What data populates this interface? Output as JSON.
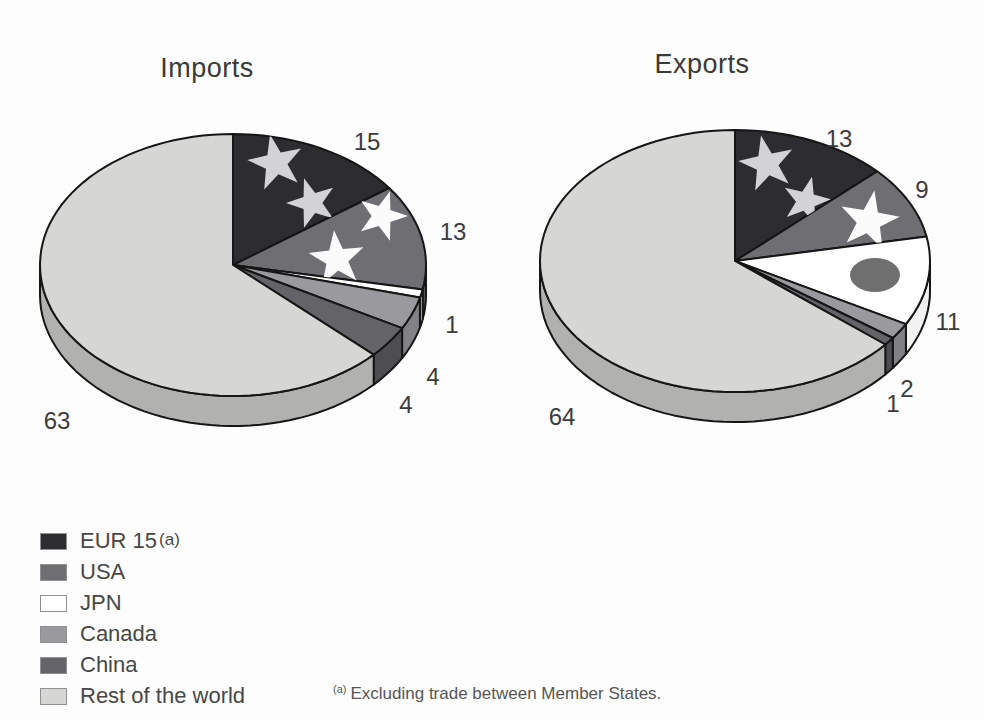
{
  "chart_data": [
    {
      "type": "pie",
      "title": "Imports",
      "start_angle_deg": 0,
      "direction": "clockwise",
      "slices": [
        {
          "label": "EUR 15",
          "value": 15,
          "color_key": "eur15"
        },
        {
          "label": "USA",
          "value": 13,
          "color_key": "usa"
        },
        {
          "label": "JPN",
          "value": 1,
          "color_key": "jpn"
        },
        {
          "label": "Canada",
          "value": 4,
          "color_key": "canada"
        },
        {
          "label": "China",
          "value": 4,
          "color_key": "china"
        },
        {
          "label": "Rest of the world",
          "value": 63,
          "color_key": "rest"
        }
      ],
      "geom": {
        "cx": 233,
        "cy": 265,
        "rx": 193,
        "ry": 131,
        "depth": 30
      },
      "value_label_pos": [
        {
          "x": 367,
          "y": 150
        },
        {
          "x": 453,
          "y": 240
        },
        {
          "x": 452,
          "y": 333
        },
        {
          "x": 433,
          "y": 385
        },
        {
          "x": 406,
          "y": 413
        },
        {
          "x": 57,
          "y": 429
        }
      ],
      "decorations": [
        {
          "slice": 0,
          "shape": "star",
          "name": "eu-flag-star",
          "x": 276,
          "y": 163,
          "r": 29,
          "rot": -12,
          "color_key": "star_light"
        },
        {
          "slice": 0,
          "shape": "star",
          "name": "eu-flag-star",
          "x": 312,
          "y": 203,
          "r": 26,
          "rot": -18,
          "color_key": "star_light"
        },
        {
          "slice": 1,
          "shape": "star",
          "name": "us-flag-star",
          "x": 382,
          "y": 216,
          "r": 26,
          "rot": 18,
          "color_key": "star_white"
        },
        {
          "slice": 1,
          "shape": "star",
          "name": "us-flag-star",
          "x": 337,
          "y": 259,
          "r": 29,
          "rot": -6,
          "color_key": "star_white"
        }
      ]
    },
    {
      "type": "pie",
      "title": "Exports",
      "start_angle_deg": 0,
      "direction": "clockwise",
      "slices": [
        {
          "label": "EUR 15",
          "value": 13,
          "color_key": "eur15"
        },
        {
          "label": "USA",
          "value": 9,
          "color_key": "usa"
        },
        {
          "label": "JPN",
          "value": 11,
          "color_key": "jpn"
        },
        {
          "label": "Canada",
          "value": 2,
          "color_key": "canada"
        },
        {
          "label": "China",
          "value": 1,
          "color_key": "china"
        },
        {
          "label": "Rest of the world",
          "value": 64,
          "color_key": "rest"
        }
      ],
      "geom": {
        "cx": 735,
        "cy": 261,
        "rx": 195,
        "ry": 131,
        "depth": 30
      },
      "value_label_pos": [
        {
          "x": 839,
          "y": 147
        },
        {
          "x": 922,
          "y": 198
        },
        {
          "x": 948,
          "y": 330
        },
        {
          "x": 907,
          "y": 397
        },
        {
          "x": 893,
          "y": 412
        },
        {
          "x": 562,
          "y": 425
        }
      ],
      "decorations": [
        {
          "slice": 0,
          "shape": "star",
          "name": "eu-flag-star",
          "x": 767,
          "y": 164,
          "r": 29,
          "rot": -12,
          "color_key": "star_light"
        },
        {
          "slice": 0,
          "shape": "star",
          "name": "eu-flag-star",
          "x": 806,
          "y": 201,
          "r": 25,
          "rot": 14,
          "color_key": "star_light"
        },
        {
          "slice": 1,
          "shape": "star",
          "name": "us-flag-star",
          "x": 869,
          "y": 221,
          "r": 31,
          "rot": 10,
          "color_key": "star_white"
        },
        {
          "slice": 2,
          "shape": "ellipse",
          "name": "japan-flag-circle",
          "x": 875,
          "y": 275,
          "rx": 25,
          "ry": 17,
          "color_key": "japan_circle"
        }
      ]
    }
  ],
  "colors": {
    "fill": {
      "eur15": "#2d2d31",
      "usa": "#6f6f73",
      "jpn": "#ffffff",
      "canada": "#9a9a9e",
      "china": "#646468",
      "rest": "#d6d6d4"
    },
    "rim": {
      "eur15": "#1f1f23",
      "usa": "#58585c",
      "jpn": "#f2f2f2",
      "canada": "#818186",
      "china": "#4e4e52",
      "rest": "#b1b1af"
    },
    "decor": {
      "star_light": "#d3d3d5",
      "star_white": "#fbfbfb",
      "japan_circle": "#6f6f6f"
    },
    "outline": "#161616",
    "label_text": "#3c3c3c"
  },
  "legend": {
    "items": [
      {
        "label": "EUR 15",
        "suffix": "(a)",
        "color_key": "eur15"
      },
      {
        "label": "USA",
        "color_key": "usa"
      },
      {
        "label": "JPN",
        "color_key": "jpn"
      },
      {
        "label": "Canada",
        "color_key": "canada"
      },
      {
        "label": "China",
        "color_key": "china"
      },
      {
        "label": "Rest of the world",
        "color_key": "rest"
      }
    ]
  },
  "footnote": {
    "marker": "(a)",
    "text": "Excluding trade between Member States."
  }
}
